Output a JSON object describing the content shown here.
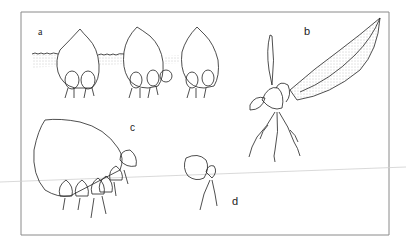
{
  "figure": {
    "panels": [
      {
        "label": "a",
        "description": "three leaves planted in soil with plantlets at base"
      },
      {
        "label": "b",
        "description": "leaf with plantlet and roots"
      },
      {
        "label": "c",
        "description": "large leaf with row of plantlets along edge"
      },
      {
        "label": "d",
        "description": "small leaf with single rooted plantlet"
      }
    ],
    "colors": {
      "line": "#222222",
      "frame": "#888888",
      "stipple": "#999999",
      "background": "#ffffff"
    }
  }
}
